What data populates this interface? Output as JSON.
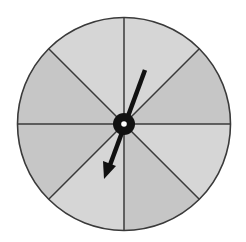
{
  "diagram": {
    "type": "spinner",
    "sector_count": 8,
    "sectors": [
      {
        "index": 1,
        "position": "top-right",
        "shade": "light"
      },
      {
        "index": 2,
        "position": "right-upper",
        "shade": "dark"
      },
      {
        "index": 3,
        "position": "right-lower",
        "shade": "light"
      },
      {
        "index": 4,
        "position": "bottom-right",
        "shade": "dark"
      },
      {
        "index": 5,
        "position": "bottom-left",
        "shade": "light"
      },
      {
        "index": 6,
        "position": "left-lower",
        "shade": "dark"
      },
      {
        "index": 7,
        "position": "left-upper",
        "shade": "dark"
      },
      {
        "index": 8,
        "position": "top-left",
        "shade": "light"
      }
    ],
    "pointer": {
      "points_to_sector": 5,
      "direction_degrees_clockwise_from_top": 200
    },
    "colors": {
      "light_sector": "#d6d6d6",
      "dark_sector": "#c6c6c6",
      "outline": "#3a3a3a",
      "pointer": "#111111",
      "hub_center": "#ffffff",
      "background": "#ffffff"
    }
  }
}
